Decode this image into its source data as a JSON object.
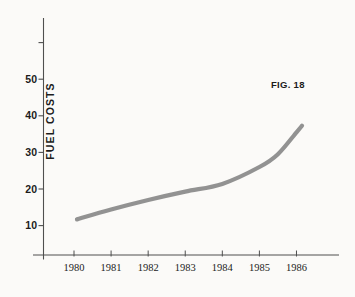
{
  "figure": {
    "annotation": "FIG. 18",
    "background_color": "#fbfaf8",
    "axis_color": "#4f4f4f",
    "text_color": "#1c1c1c"
  },
  "chart_data": {
    "type": "line",
    "title": "",
    "ylabel": "FUEL COSTS",
    "xlabel": "",
    "annotation": "FIG. 18",
    "categories": [
      1980,
      1981,
      1982,
      1983,
      1984,
      1985,
      1986
    ],
    "values": [
      11.5,
      14.5,
      17,
      19.5,
      21.5,
      26,
      35.5
    ],
    "x_ticks": [
      1980,
      1981,
      1982,
      1983,
      1984,
      1985,
      1986
    ],
    "y_ticks_labeled": [
      10,
      20,
      30,
      40,
      50
    ],
    "y_ticks_unlabeled": [
      60
    ],
    "xlim": [
      1980,
      1986
    ],
    "ylim": [
      0,
      60
    ],
    "grid": false,
    "legend": "none",
    "line_color": "#8c8c8c",
    "line_width": 4.2,
    "curve_points": [
      {
        "year": 1980.08,
        "value": 11.7
      },
      {
        "year": 1981,
        "value": 14.4
      },
      {
        "year": 1982,
        "value": 17.0
      },
      {
        "year": 1983,
        "value": 19.3
      },
      {
        "year": 1984,
        "value": 21.4
      },
      {
        "year": 1985,
        "value": 26.0
      },
      {
        "year": 1985.5,
        "value": 29.5
      },
      {
        "year": 1986,
        "value": 35.5
      },
      {
        "year": 1986.15,
        "value": 37.3
      }
    ]
  }
}
